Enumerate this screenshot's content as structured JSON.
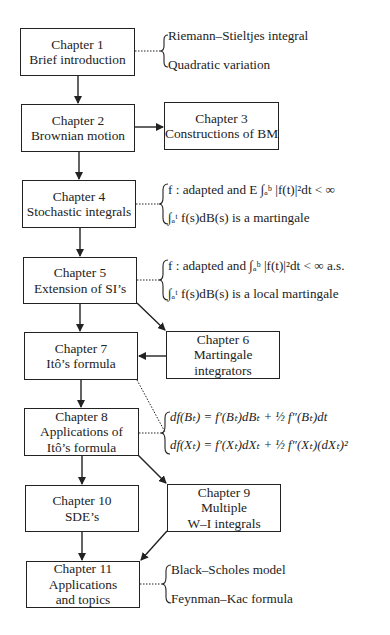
{
  "diagram": {
    "type": "chapter-dependency-flowchart",
    "nodes": [
      {
        "id": "ch1",
        "lines": [
          "Chapter 1",
          "Brief introduction"
        ]
      },
      {
        "id": "ch2",
        "lines": [
          "Chapter 2",
          "Brownian motion"
        ]
      },
      {
        "id": "ch3",
        "lines": [
          "Chapter 3",
          "Constructions of BM"
        ]
      },
      {
        "id": "ch4",
        "lines": [
          "Chapter 4",
          "Stochastic integrals"
        ]
      },
      {
        "id": "ch5",
        "lines": [
          "Chapter 5",
          "Extension of SI’s"
        ]
      },
      {
        "id": "ch6",
        "lines": [
          "Chapter 6",
          "Martingale",
          "integrators"
        ]
      },
      {
        "id": "ch7",
        "lines": [
          "Chapter 7",
          "Itô’s formula"
        ]
      },
      {
        "id": "ch8",
        "lines": [
          "Chapter 8",
          "Applications of",
          "Itô’s formula"
        ]
      },
      {
        "id": "ch9",
        "lines": [
          "Chapter 9",
          "Multiple",
          "W–I integrals"
        ]
      },
      {
        "id": "ch10",
        "lines": [
          "Chapter 10",
          "SDE’s"
        ]
      },
      {
        "id": "ch11",
        "lines": [
          "Chapter 11",
          "Applications",
          "and topics"
        ]
      }
    ],
    "edges": [
      {
        "from": "ch1",
        "to": "ch2"
      },
      {
        "from": "ch2",
        "to": "ch3"
      },
      {
        "from": "ch2",
        "to": "ch4"
      },
      {
        "from": "ch4",
        "to": "ch5"
      },
      {
        "from": "ch5",
        "to": "ch7"
      },
      {
        "from": "ch5",
        "to": "ch6"
      },
      {
        "from": "ch6",
        "to": "ch7"
      },
      {
        "from": "ch7",
        "to": "ch8"
      },
      {
        "from": "ch8",
        "to": "ch10"
      },
      {
        "from": "ch8",
        "to": "ch9"
      },
      {
        "from": "ch10",
        "to": "ch11"
      },
      {
        "from": "ch9",
        "to": "ch11"
      }
    ],
    "annotations": {
      "ch1": [
        "Riemann–Stieltjes integral",
        "Quadratic variation"
      ],
      "ch4": [
        "f : adapted and E ∫ₐᵇ |f(t)|²dt < ∞",
        "∫ₐᵗ f(s)dB(s) is a martingale"
      ],
      "ch5": [
        "f : adapted and  ∫ₐᵇ |f(t)|²dt < ∞ a.s.",
        "∫ₐᵗ f(s)dB(s) is a local martingale"
      ],
      "ch7_8": [
        "df(Bₜ) = f′(Bₜ)dBₜ + ½ f″(Bₜ)dt",
        "df(Xₜ) = f′(Xₜ)dXₜ + ½ f″(Xₜ)(dXₜ)²"
      ],
      "ch11": [
        "Black–Scholes model",
        "Feynman–Kac formula"
      ]
    },
    "colors": {
      "line": "#222222",
      "background": "#ffffff"
    }
  }
}
